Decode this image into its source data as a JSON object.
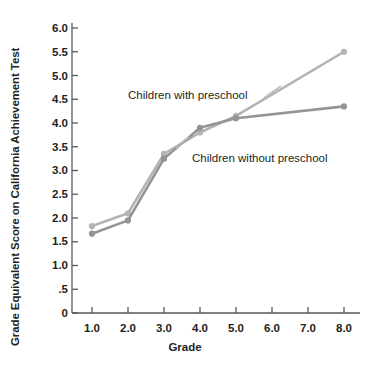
{
  "chart_data": {
    "type": "line",
    "title": "",
    "xlabel": "Grade",
    "ylabel": "Grade Equivalent Score on California Achievement Test",
    "categories": [
      "1.0",
      "2.0",
      "3.0",
      "4.0",
      "5.0",
      "6.0",
      "7.0",
      "8.0"
    ],
    "x": [
      1.0,
      2.0,
      3.0,
      4.0,
      5.0,
      8.0
    ],
    "xlim": [
      1.0,
      8.0
    ],
    "ylim": [
      0,
      6.0
    ],
    "yticks": [
      "0",
      ".5",
      "1.0",
      "1.5",
      "2.0",
      "2.5",
      "3.0",
      "3.5",
      "4.0",
      "4.5",
      "5.0",
      "5.5",
      "6.0"
    ],
    "ytick_values": [
      0,
      0.5,
      1.0,
      1.5,
      2.0,
      2.5,
      3.0,
      3.5,
      4.0,
      4.5,
      5.0,
      5.5,
      6.0
    ],
    "grid": false,
    "legend_position": "inline-annotation",
    "series": [
      {
        "name": "Children with preschool",
        "color": "#b3b3b3",
        "x": [
          1.0,
          2.0,
          3.0,
          4.0,
          5.0,
          8.0
        ],
        "values": [
          1.83,
          2.1,
          3.35,
          3.8,
          4.15,
          5.5
        ]
      },
      {
        "name": "Children without preschool",
        "color": "#949494",
        "x": [
          1.0,
          2.0,
          3.0,
          4.0,
          5.0,
          8.0
        ],
        "values": [
          1.67,
          1.95,
          3.25,
          3.9,
          4.1,
          4.35
        ]
      }
    ],
    "annotations": [
      {
        "text": "Children with preschool",
        "series": "Children with preschool"
      },
      {
        "text": "Children without preschool",
        "series": "Children without preschool"
      }
    ],
    "axis_color": "#58595b"
  }
}
